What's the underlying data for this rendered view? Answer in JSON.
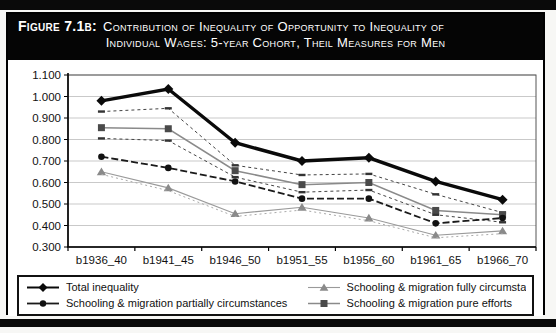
{
  "figure": {
    "label": "Figure 7.1b:",
    "title_line1": "Contribution of Inequality of Opportunity to Inequality of",
    "title_line2": "Individual Wages: 5-year Cohort, Theil Measures for Men"
  },
  "colors": {
    "title_bg": "#050505",
    "title_fg": "#ffffff",
    "grid": "#c9c9c9",
    "frame": "#555555",
    "axis": "#000000"
  },
  "chart_data": {
    "type": "line",
    "title": "Contribution of Inequality of Opportunity to Inequality of Individual Wages: 5-year Cohort, Theil Measures for Men",
    "categories": [
      "b1936_40",
      "b1941_45",
      "b1946_50",
      "b1951_55",
      "b1956_60",
      "b1961_65",
      "b1966_70"
    ],
    "ylim": [
      0.3,
      1.1
    ],
    "y_ticks": [
      "1.100",
      "0.900",
      "0.800",
      "0.700",
      "0.600",
      "0.500",
      "0.400",
      "0.300",
      "1.000"
    ],
    "grid": true,
    "legend_position": "bottom",
    "series": [
      {
        "name": "Total inequality",
        "marker": "diamond",
        "marker_color": "#0a0a0a",
        "line": "solid-thick",
        "color": "#0a0a0a",
        "in_legend": true,
        "values": [
          0.98,
          1.035,
          0.785,
          0.7,
          0.715,
          0.605,
          0.52
        ]
      },
      {
        "name": "upper dashed bound",
        "marker": "dash",
        "marker_color": "#333333",
        "line": "dotted",
        "color": "#444444",
        "in_legend": false,
        "values": [
          0.93,
          0.945,
          0.68,
          0.635,
          0.64,
          0.545,
          0.46
        ]
      },
      {
        "name": "Schooling & migration pure efforts",
        "marker": "square",
        "marker_color": "#4a4a4a",
        "line": "solid",
        "color": "#8a8a8a",
        "in_legend": true,
        "values": [
          0.855,
          0.85,
          0.655,
          0.59,
          0.6,
          0.47,
          0.45
        ]
      },
      {
        "name": "lower dashed bound",
        "marker": "dash",
        "marker_color": "#333333",
        "line": "dotted",
        "color": "#444444",
        "in_legend": false,
        "values": [
          0.805,
          0.795,
          0.625,
          0.555,
          0.565,
          0.45,
          0.415
        ]
      },
      {
        "name": "Schooling & migration partially circumstances",
        "marker": "circle",
        "marker_color": "#111111",
        "line": "dashed",
        "color": "#1a1a1a",
        "in_legend": true,
        "values": [
          0.72,
          0.668,
          0.605,
          0.525,
          0.525,
          0.41,
          0.435
        ]
      },
      {
        "name": "Schooling & migration fully circumstances",
        "marker": "triangle",
        "marker_color": "#8a8a8a",
        "line": "solid-thin",
        "color": "#9a9a9a",
        "in_legend": true,
        "values": [
          0.65,
          0.575,
          0.455,
          0.485,
          0.435,
          0.355,
          0.375
        ]
      },
      {
        "name": "fully circumstances dashed companion",
        "marker": "none",
        "marker_color": "#aaaaaa",
        "line": "dotted-thin",
        "color": "#aaaaaa",
        "in_legend": false,
        "values": [
          0.638,
          0.562,
          0.442,
          0.472,
          0.422,
          0.343,
          0.362
        ]
      }
    ]
  },
  "legend": {
    "items": [
      {
        "label": "Total inequality",
        "series_index": 0
      },
      {
        "label": "Schooling & migration fully circumstances",
        "series_index": 5
      },
      {
        "label": "Schooling & migration partially circumstances",
        "series_index": 4
      },
      {
        "label": "Schooling & migration pure efforts",
        "series_index": 2
      }
    ]
  }
}
